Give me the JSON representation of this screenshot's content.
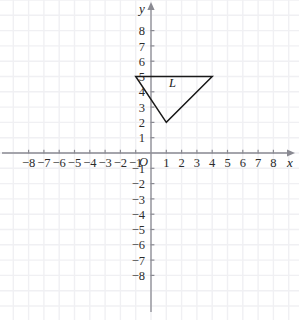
{
  "figure": {
    "background_color": "#ffffff",
    "grid_color": "#f0f0f3",
    "axis_color": "#8a8a92",
    "shape_color": "#1a1a1a",
    "width": 299,
    "height": 320
  },
  "axes": {
    "x_axis_label": "x",
    "y_axis_label": "y",
    "origin_label": "O",
    "x_ticks": [
      -8,
      -7,
      -6,
      -5,
      -4,
      -3,
      -2,
      -1,
      1,
      2,
      3,
      4,
      5,
      6,
      7,
      8
    ],
    "y_ticks": [
      8,
      7,
      6,
      5,
      4,
      3,
      2,
      1,
      -1,
      -2,
      -3,
      -4,
      -5,
      -6,
      -7,
      -8
    ],
    "x_tick_labels": [
      "−8",
      "−7",
      "−6",
      "−5",
      "−4",
      "−3",
      "−2",
      "−1",
      "1",
      "2",
      "3",
      "4",
      "5",
      "6",
      "7",
      "8"
    ],
    "y_tick_labels": [
      "8",
      "7",
      "6",
      "5",
      "4",
      "3",
      "2",
      "1",
      "−1",
      "−2",
      "−3",
      "−4",
      "−5",
      "−6",
      "−7",
      "−8"
    ],
    "xlim": [
      -9.9,
      9.0
    ],
    "ylim": [
      -10.0,
      10.0
    ],
    "grid": true,
    "x_arrow": true,
    "y_arrow": true
  },
  "chart_data": {
    "type": "scatter",
    "title": "",
    "xlabel": "x",
    "ylabel": "y",
    "xlim": [
      -9.9,
      9.0
    ],
    "ylim": [
      -10.0,
      10.0
    ],
    "grid": true,
    "shapes": [
      {
        "name": "triangle-L",
        "label": "L",
        "label_position": [
          1.4,
          4.3
        ],
        "closed": true,
        "vertices": [
          [
            -1,
            5
          ],
          [
            4,
            5
          ],
          [
            1,
            2
          ]
        ]
      }
    ]
  }
}
